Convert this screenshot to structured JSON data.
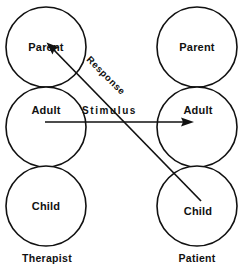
{
  "diagram": {
    "type": "transactional-analysis-crossed-transaction",
    "columns": [
      {
        "id": "therapist",
        "person_label": "Therapist",
        "cx": 46,
        "ego_states": [
          {
            "id": "parent",
            "label": "Parent",
            "cy": 47
          },
          {
            "id": "adult",
            "label": "Adult",
            "cy": 127
          },
          {
            "id": "child",
            "label": "Child",
            "cy": 206
          }
        ]
      },
      {
        "id": "patient",
        "person_label": "Patient",
        "cx": 197,
        "ego_states": [
          {
            "id": "parent",
            "label": "Parent",
            "cy": 47
          },
          {
            "id": "adult",
            "label": "Adult",
            "cy": 127
          },
          {
            "id": "child",
            "label": "Child",
            "cy": 206
          }
        ]
      }
    ],
    "circle_radius": 40,
    "vectors": [
      {
        "id": "stimulus",
        "label": "Stimulus",
        "from": "therapist-adult",
        "to": "patient-adult",
        "x1": 45,
        "y1": 122,
        "x2": 194,
        "y2": 122,
        "label_x": 82,
        "label_y": 113,
        "rotation": 0
      },
      {
        "id": "response",
        "label": "Response",
        "from": "patient-child",
        "to": "therapist-parent",
        "x1": 201,
        "y1": 201,
        "x2": 47,
        "y2": 43,
        "label_x": 86,
        "label_y": 60,
        "rotation": 45
      }
    ],
    "colors": {
      "ink": "#111111",
      "background": "#ffffff"
    }
  }
}
